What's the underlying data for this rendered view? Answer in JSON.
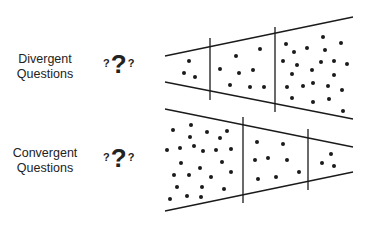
{
  "diagram": {
    "rows": [
      {
        "id": "divergent",
        "label_line1": "Divergent",
        "label_line2": "Questions",
        "qmark_small_left": "?",
        "qmark_big": "?",
        "qmark_small_right": "?",
        "shape": "funnel-widening",
        "sections": [
          {
            "dots": 3
          },
          {
            "dots": 9
          },
          {
            "dots": 28
          }
        ]
      },
      {
        "id": "convergent",
        "label_line1": "Convergent",
        "label_line2": "Questions",
        "qmark_small_left": "?",
        "qmark_big": "?",
        "qmark_small_right": "?",
        "shape": "funnel-narrowing",
        "sections": [
          {
            "dots": 28
          },
          {
            "dots": 8
          },
          {
            "dots": 3
          }
        ]
      }
    ],
    "colors": {
      "line": "#1a1a1a",
      "dot": "#1a1a1a",
      "background": "#ffffff"
    }
  }
}
